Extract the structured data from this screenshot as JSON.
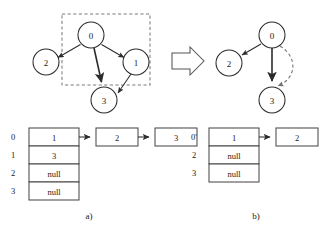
{
  "figure": {
    "caption_a": "a)",
    "caption_b": "b)",
    "transition_arrow": "right-block-arrow"
  },
  "panel_a": {
    "graph": {
      "nodes": [
        {
          "id": "0",
          "label": "0",
          "cx": 91,
          "cy": 35,
          "r": 13
        },
        {
          "id": "2",
          "label": "2",
          "cx": 46,
          "cy": 62,
          "r": 13
        },
        {
          "id": "1",
          "label": "1",
          "cx": 136,
          "cy": 62,
          "r": 13
        },
        {
          "id": "3",
          "label": "3",
          "cx": 104,
          "cy": 100,
          "r": 13
        }
      ],
      "edges": [
        {
          "from": "0",
          "to": "2",
          "style": "solid"
        },
        {
          "from": "0",
          "to": "1",
          "style": "solid"
        },
        {
          "from": "0",
          "to": "3",
          "style": "solid-thick"
        },
        {
          "from": "1",
          "to": "3",
          "style": "solid"
        }
      ],
      "highlight_region": {
        "x": 62,
        "y": 14,
        "width": 88,
        "height": 71,
        "style": "dashed"
      }
    },
    "adjacency_list": {
      "indices": [
        "0",
        "1",
        "2",
        "3"
      ],
      "head_values": [
        "1",
        "3",
        "null",
        "null"
      ],
      "chains": [
        {
          "row": 0,
          "nodes": [
            "2",
            "3"
          ]
        }
      ]
    }
  },
  "panel_b": {
    "graph": {
      "nodes": [
        {
          "id": "0",
          "label": "0",
          "cx": 272,
          "cy": 35,
          "r": 13
        },
        {
          "id": "2",
          "label": "2",
          "cx": 229,
          "cy": 63,
          "r": 13
        },
        {
          "id": "3",
          "label": "3",
          "cx": 272,
          "cy": 100,
          "r": 13
        }
      ],
      "edges": [
        {
          "from": "0",
          "to": "2",
          "style": "solid"
        },
        {
          "from": "0",
          "to": "3",
          "style": "solid-thick"
        },
        {
          "from": "0",
          "to": "3",
          "style": "dashed-curve"
        }
      ]
    },
    "adjacency_list": {
      "indices": [
        "0'",
        "2",
        "3"
      ],
      "head_values": [
        "1",
        "null",
        "null"
      ],
      "chains": [
        {
          "row": 0,
          "nodes": [
            "2"
          ]
        }
      ]
    }
  },
  "colors": {
    "stroke": "#2b2b2b",
    "dashed": "#7d7d7d",
    "background": "#ffffff"
  }
}
